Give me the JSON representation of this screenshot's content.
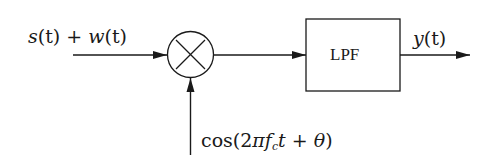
{
  "diagram": {
    "type": "block-diagram",
    "nodes": [
      {
        "id": "mixer",
        "kind": "multiplier",
        "symbol": "×"
      },
      {
        "id": "lpf",
        "kind": "block",
        "label": "LPF"
      }
    ],
    "edges": [
      {
        "from": "input",
        "to": "mixer",
        "label": "s(t) + w(t)"
      },
      {
        "from": "local-oscillator",
        "to": "mixer",
        "label": "cos(2πf_c t + θ)"
      },
      {
        "from": "mixer",
        "to": "lpf",
        "label": ""
      },
      {
        "from": "lpf",
        "to": "output",
        "label": "y(t)"
      }
    ]
  },
  "labels": {
    "input": {
      "s": "s",
      "t1": "(t) + ",
      "w": "w",
      "t2": "(t)"
    },
    "output": {
      "y": "y",
      "t": "(t)"
    },
    "lo": {
      "cos": "cos(2",
      "pi": "π",
      "f": "f",
      "c": "c",
      "t": "t",
      "plus": " + ",
      "theta": "θ",
      "close": ")"
    },
    "lpf": "LPF"
  },
  "colors": {
    "stroke": "#1a1a1a",
    "background": "#ffffff"
  }
}
